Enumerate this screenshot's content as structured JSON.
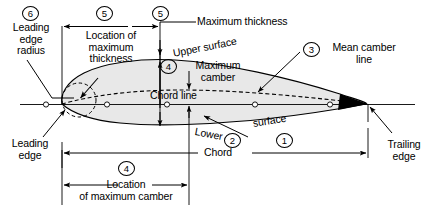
{
  "diagram": {
    "colors": {
      "stroke": "#000000",
      "fill": "#e8e8e8",
      "background": "#ffffff"
    },
    "labels": {
      "leading_edge_radius": "Leading\nedge\nradius",
      "location_of_max_thickness": "Location of\nmaximum\nthickness",
      "maximum_thickness": "Maximum thickness",
      "upper_surface": "Upper surface",
      "mean_camber_line": "Mean camber\nline",
      "maximum_camber": "Maximum\ncamber",
      "chord_line": "Chord line",
      "lower": "Lower",
      "surface": "surface",
      "leading_edge": "Leading\nedge",
      "trailing_edge": "Trailing\nedge",
      "chord": "Chord",
      "location_of_max_camber": "Location\nof maximum camber"
    },
    "callouts": [
      {
        "id": "callout-1",
        "number": "1"
      },
      {
        "id": "callout-2",
        "number": "2"
      },
      {
        "id": "callout-3",
        "number": "3"
      },
      {
        "id": "callout-4-camber",
        "number": "4"
      },
      {
        "id": "callout-4-location",
        "number": "4"
      },
      {
        "id": "callout-5-location",
        "number": "5"
      },
      {
        "id": "callout-5-thickness",
        "number": "5"
      },
      {
        "id": "callout-6",
        "number": "6"
      }
    ]
  }
}
